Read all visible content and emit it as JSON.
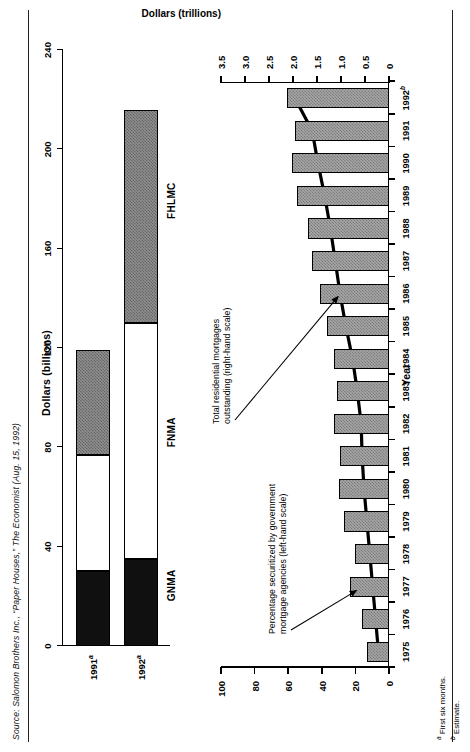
{
  "source": {
    "text": "Source: Salomon Brothers Inc., “Paper Houses,” The Economist (Aug. 15, 1992)"
  },
  "footnotes": [
    {
      "marker": "a",
      "text": "First six months."
    },
    {
      "marker": "b",
      "text": "Estimate."
    }
  ],
  "colors": {
    "gnma": "#101010",
    "fnma": "#ffffff",
    "fhlmc": "#8f8f8f",
    "bar": "#a6a6a6",
    "line": "#000000",
    "axis": "#000000"
  },
  "chart_data": [
    {
      "type": "bar",
      "orientation": "horizontal",
      "stacked": true,
      "title": "Dollars (billions)",
      "xlabel": "Dollars (billions)",
      "ylabel": "",
      "xlim": [
        0,
        240
      ],
      "xticks": [
        0,
        40,
        80,
        120,
        160,
        200,
        240
      ],
      "grid": false,
      "categories": [
        "1991ᵃ",
        "1992ᵃ"
      ],
      "category_labels": [
        {
          "year": "1991",
          "marker": "a"
        },
        {
          "year": "1992",
          "marker": "a"
        }
      ],
      "series": [
        {
          "name": "GNMA",
          "values": [
            30,
            35
          ]
        },
        {
          "name": "FNMA",
          "values": [
            47,
            95
          ]
        },
        {
          "name": "FHLMC",
          "values": [
            42,
            86
          ]
        }
      ],
      "segment_labels": [
        "GNMA",
        "FNMA",
        "FHLMC"
      ],
      "totals": [
        119,
        216
      ]
    },
    {
      "type": "bar+line",
      "title": "",
      "xlabel": "Year",
      "ylabel_left": "",
      "ylabel_right": "Dollars (trillions)",
      "grid": false,
      "x": [
        "1975",
        "1976",
        "1977",
        "1978",
        "1979",
        "1980",
        "1981",
        "1982",
        "1983",
        "1984",
        "1985",
        "1986",
        "1987",
        "1988",
        "1989",
        "1990",
        "1991",
        "1992ᵇ"
      ],
      "x_markers": {
        "1992": "b"
      },
      "xticks": [
        "1975",
        "1976",
        "1977",
        "1978",
        "1979",
        "1980",
        "1981",
        "1982",
        "1983",
        "1984",
        "1985",
        "1986",
        "1987",
        "1988",
        "1989",
        "1990",
        "1991",
        "1992"
      ],
      "left_axis": {
        "label": "Percentage",
        "ylim": [
          0,
          100
        ],
        "yticks": [
          0,
          20,
          40,
          60,
          80,
          100
        ]
      },
      "right_axis": {
        "label": "Dollars (trillions)",
        "ylim": [
          0,
          3.5
        ],
        "yticks": [
          0,
          0.5,
          1.0,
          1.5,
          2.0,
          2.5,
          3.0,
          3.5
        ]
      },
      "series": [
        {
          "name": "Percentage securitized by government mortgage agencies (left-hand scale)",
          "type": "bar",
          "axis": "left",
          "values": [
            13,
            16,
            23,
            20,
            27,
            30,
            29,
            33,
            31,
            33,
            37,
            41,
            46,
            48,
            55,
            58,
            56,
            61
          ]
        },
        {
          "name": "Total residential mortgages outstanding (right-hand scale)",
          "type": "line",
          "axis": "right",
          "values": [
            0.22,
            0.28,
            0.34,
            0.4,
            0.46,
            0.52,
            0.56,
            0.58,
            0.66,
            0.76,
            0.9,
            1.02,
            1.12,
            1.22,
            1.34,
            1.48,
            1.6,
            1.96
          ]
        }
      ],
      "annotations": [
        {
          "id": "annot-left",
          "line1": "Percentage securitized by government",
          "line2": "mortgage agencies (left-hand scale)",
          "target": "1977"
        },
        {
          "id": "annot-right",
          "line1": "Total residential mortgages",
          "line2": "outstanding (right-hand scale)",
          "target": "1986"
        }
      ]
    }
  ]
}
